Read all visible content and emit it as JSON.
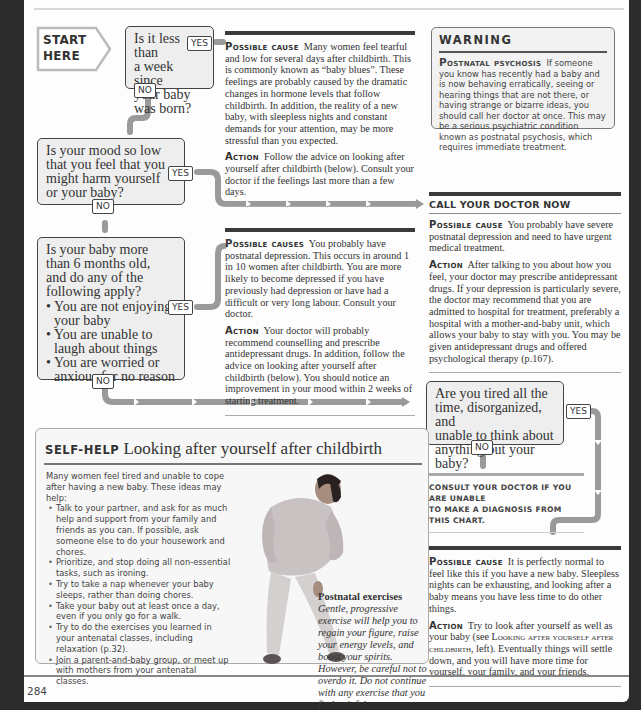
{
  "page_number": "284",
  "flowchart": {
    "start_label": [
      "START",
      "HERE"
    ],
    "yes_label": "YES",
    "no_label": "NO",
    "questions": [
      {
        "id": "q1",
        "lines": [
          "Is it less than",
          "a week since",
          "your baby",
          "was born?"
        ]
      },
      {
        "id": "q2",
        "lines": [
          "Is your mood so low",
          "that you feel that you",
          "might harm yourself",
          "or your baby?"
        ]
      },
      {
        "id": "q3",
        "lines": [
          "Is your baby more",
          "than 6 months old,",
          "and do any of the",
          "following apply?"
        ],
        "bullets": [
          [
            "You are not enjoying",
            "your baby"
          ],
          [
            "You are unable to",
            "laugh about things"
          ],
          [
            "You are worried or",
            "anxious for no reason"
          ]
        ]
      },
      {
        "id": "q4",
        "lines": [
          "Are you tired all the",
          "time, disorganized, and",
          "unable to think about",
          "anything but your baby?"
        ]
      }
    ]
  },
  "outcomes": {
    "baby_blues": {
      "cause_label": "Possible cause",
      "cause_text": "Many women feel tearful and low for several days after childbirth. This is commonly known as “baby blues”. These feelings are probably caused by the dramatic changes in hormone levels that follow childbirth. In addition, the reality of a new baby, with sleepless nights and constant demands for your attention, may be more stressful than you expected.",
      "action_label": "Action",
      "action_text": "Follow the advice on looking after yourself after childbirth (below). Consult your doctor if the feelings last more than a few days."
    },
    "call_doctor": {
      "heading": "CALL YOUR DOCTOR NOW",
      "cause_label": "Possible cause",
      "cause_text": "You probably have severe postnatal depression and need to have urgent medical treatment.",
      "action_label": "Action",
      "action_text": "After talking to you about how you feel, your doctor may prescribe antidepressant drugs. If your depression is particularly severe, the doctor may recommend that you are admitted to hospital for treatment, preferably a hospital with a mother-and-baby unit, which allows your baby to stay with you. You may be given antidepressant drugs and offered psychological therapy (p.167)."
    },
    "postnatal_depression": {
      "cause_label": "Possible causes",
      "cause_text": "You probably have postnatal depression. This occurs in around 1 in 10 women after childbirth. You are more likely to become depressed if you have previously had depression or have had a difficult or very long labour. Consult your doctor.",
      "action_label": "Action",
      "action_text": "Your doctor will probably recommend counselling and prescribe antidepressant drugs. In addition, follow the advice on looking after yourself after childbirth (below). You should notice an improvement in your mood within 2 weeks of starting treatment."
    },
    "consult": {
      "text_line1": "Consult your doctor if you are unable",
      "text_line2": "to make a diagnosis from this chart."
    },
    "tiredness": {
      "cause_label": "Possible cause",
      "cause_text": "It is perfectly normal to feel like this if you have a new baby. Sleepless nights can be exhausting, and looking after a baby means you have less time to do other things.",
      "action_label": "Action",
      "action_pre": "Try to look after yourself as well as your baby (see ",
      "action_ref": "Looking after yourself after childbirth",
      "action_post": ", left). Eventually things will settle down, and you will have more time for yourself, your family, and your friends."
    }
  },
  "warning": {
    "title": "WARNING",
    "label": "Postnatal psychosis",
    "text": "If someone you know has recently had a baby and is now behaving erratically, seeing or hearing things that are not there, or having strange or bizarre ideas, you should call her doctor at once. This may be a serious psychiatric condition known as postnatal psychosis, which requires immediate treatment."
  },
  "self_help": {
    "tag": "SELF-HELP",
    "title": "Looking after yourself after childbirth",
    "intro": "Many women feel tired and unable to cope after having a new baby. These ideas may help:",
    "items": [
      "Talk to your partner, and ask for as much help and support from your family and friends as you can. If possible, ask someone else to do your housework and chores.",
      "Prioritize, and stop doing all non-essential tasks, such as ironing.",
      "Try to take a nap whenever your baby sleeps, rather than doing chores.",
      "Take your baby out at least once a day, even if you only go for a walk.",
      "Try to do the exercises you learned in your antenatal classes, including relaxation (p.32).",
      "Join a parent-and-baby group, or meet up with mothers from your antenatal classes."
    ],
    "caption_title": "Postnatal exercises",
    "caption_text": "Gentle, progressive exercise will help you to regain your figure, raise your energy levels, and boost your spirits. However, be careful not to overdo it. Do not continue with any exercise that you find painful."
  }
}
